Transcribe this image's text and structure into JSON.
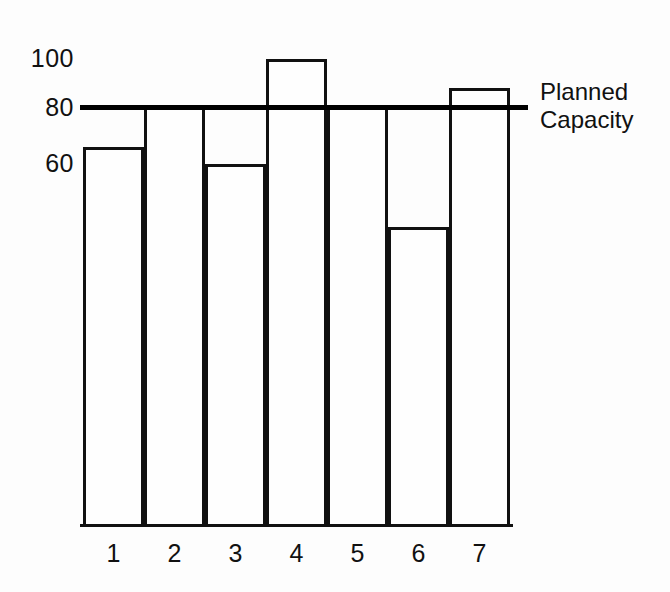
{
  "chart_data": {
    "type": "bar",
    "title": "",
    "subtitle": "",
    "xlabel": "",
    "ylabel": "",
    "categories": [
      "1",
      "2",
      "3",
      "4",
      "5",
      "6",
      "7"
    ],
    "values": [
      66,
      80,
      62,
      98,
      80,
      36,
      87
    ],
    "series": [
      {
        "name": "Load",
        "values": [
          66,
          80,
          62,
          98,
          80,
          36,
          87
        ]
      }
    ],
    "ylim": [
      -70,
      105
    ],
    "y_ticks": [
      100,
      80,
      60
    ],
    "y_tick_labels": [
      "100",
      "80",
      "60"
    ],
    "grid": false,
    "legend_position": "right",
    "annotations": [
      {
        "name": "planned-capacity",
        "label_line1": "Planned",
        "label_line2": "Capacity",
        "value": 80,
        "orientation": "horizontal"
      }
    ],
    "style": {
      "bar_fill": "#ffffff",
      "bar_stroke": "#111111",
      "axis_color": "#111111",
      "reference_line_color": "#000000",
      "background": "#ffffff"
    }
  },
  "axes": {
    "y_ticks": [
      {
        "label": "100",
        "top": 46
      },
      {
        "label": "80",
        "top": 95
      },
      {
        "label": "60",
        "top": 151
      }
    ],
    "x_ticks": [
      {
        "label": "1",
        "left": 0
      },
      {
        "label": "2",
        "left": 61
      },
      {
        "label": "3",
        "left": 122
      },
      {
        "label": "4",
        "left": 183
      },
      {
        "label": "5",
        "left": 244
      },
      {
        "label": "6",
        "left": 305
      },
      {
        "label": "7",
        "left": 366
      }
    ]
  },
  "bars": [
    {
      "label": "1",
      "value": 66,
      "left": 0,
      "width": 61,
      "height": 378
    },
    {
      "label": "2",
      "value": 80,
      "left": 61,
      "width": 61,
      "height": 418
    },
    {
      "label": "3",
      "value": 62,
      "left": 122,
      "width": 61,
      "height": 361
    },
    {
      "label": "4",
      "value": 98,
      "left": 183,
      "width": 61,
      "height": 466
    },
    {
      "label": "5",
      "value": 80,
      "left": 244,
      "width": 61,
      "height": 418
    },
    {
      "label": "6",
      "value": 36,
      "left": 305,
      "width": 61,
      "height": 298
    },
    {
      "label": "7",
      "value": 87,
      "left": 366,
      "width": 61,
      "height": 437
    }
  ],
  "capacity": {
    "line1": "Planned",
    "line2": "Capacity"
  }
}
